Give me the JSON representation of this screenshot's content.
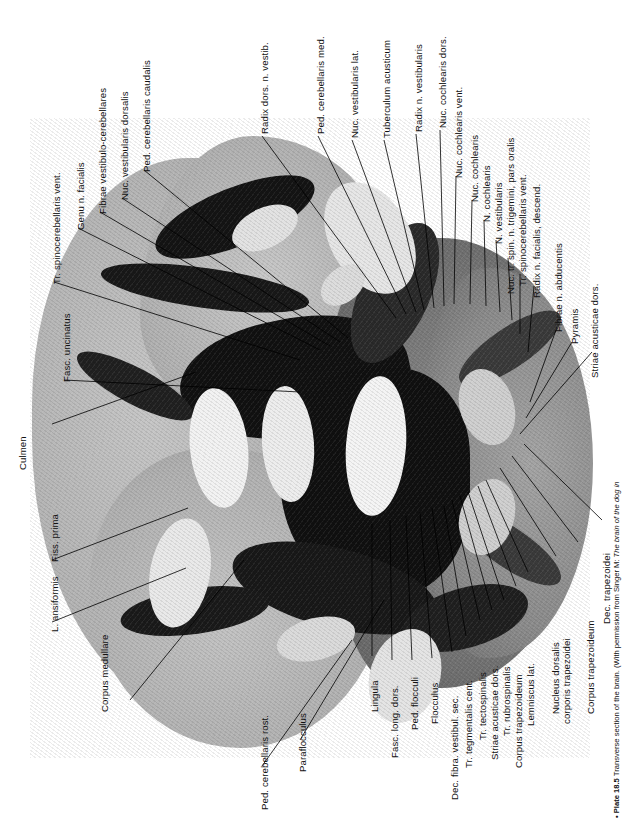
{
  "figure": {
    "plate_label": "Plate 18.5",
    "bullet": "•",
    "caption_main": "Transverse section of the brain. (With permission from Singer M:",
    "caption_italic": "The brain of the dog in",
    "caption_tail": ""
  },
  "labels_left": [
    {
      "id": "tr-spinocerebellaris-vent",
      "text": "Tr. spinocerebellaris vent."
    },
    {
      "id": "genu-n-facialis",
      "text": "Genu n. facialis"
    },
    {
      "id": "fibrae-vestibulo-cerebellares",
      "text": "Fibrae vestibulo-cerebellares"
    },
    {
      "id": "nuc-vestibularis-dorsalis",
      "text": "Nuc. vestibularis dorsalis"
    },
    {
      "id": "ped-cerebellaris-caudalis",
      "text": "Ped. cerebellaris caudalis"
    },
    {
      "id": "fasc-uncinatus",
      "text": "Fasc. uncinatus"
    },
    {
      "id": "culmen",
      "text": "Culmen"
    },
    {
      "id": "fiss-prima",
      "text": "Fiss. prima"
    },
    {
      "id": "l-ansiformis",
      "text": "L. ansiformis"
    },
    {
      "id": "corpus-medullare",
      "text": "Corpus medullare"
    },
    {
      "id": "ped-cerebellaris-rost",
      "text": "Ped. cerebellaris rost."
    },
    {
      "id": "paraflocculus",
      "text": "Paraflocculus"
    }
  ],
  "labels_bottom": [
    {
      "id": "lingula",
      "text": "Lingula"
    },
    {
      "id": "fasc-long-dors",
      "text": "Fasc. long. dors."
    },
    {
      "id": "ped-flocculi",
      "text": "Ped. flocculi"
    },
    {
      "id": "flocculus",
      "text": "Flocculus"
    },
    {
      "id": "dec-fibra-vestibul-sec",
      "text": "Dec. fibra. vestibul. sec."
    },
    {
      "id": "tr-tegmentalis-cent",
      "text": "Tr. tegmentalis cent."
    },
    {
      "id": "tr-tectospinalis",
      "text": "Tr. tectospinalis"
    },
    {
      "id": "striae-acusticae-dors",
      "text": "Striae acusticae dors."
    },
    {
      "id": "tr-rubrospinalis",
      "text": "Tr. rubrospinalis"
    },
    {
      "id": "corpus-trapezoideum-lower",
      "text": "Corpus trapezoideum"
    },
    {
      "id": "lemniscus-lat",
      "text": "Lemniscus lat."
    },
    {
      "id": "nucleus-dorsalis-corporis-trapezoidei-l1",
      "text": "Nucleus dorsalis"
    },
    {
      "id": "nucleus-dorsalis-corporis-trapezoidei-l2",
      "text": "corporis trapezoidei"
    },
    {
      "id": "corpus-trapezoideum-right",
      "text": "Corpus trapezoideum"
    },
    {
      "id": "dec-trapezoidei",
      "text": "Dec. trapezoidei"
    }
  ],
  "labels_top": [
    {
      "id": "radix-dors-n-vestib",
      "text": "Radix dors. n. vestib."
    },
    {
      "id": "ped-cerebellaris-med",
      "text": "Ped. cerebellaris med."
    },
    {
      "id": "nuc-vestibularis-lat",
      "text": "Nuc. vestibularis lat."
    },
    {
      "id": "tuberculum-acusticum",
      "text": "Tuberculum acusticum"
    },
    {
      "id": "radix-n-vestibularis",
      "text": "Radix n. vestibularis"
    },
    {
      "id": "nuc-cochlearis-dors",
      "text": "Nuc. cochlearis dors."
    },
    {
      "id": "nuc-cochlearis-vent",
      "text": "Nuc. cochlearis vent."
    },
    {
      "id": "nuc-cochlearis",
      "text": "Nuc. cochlearis"
    },
    {
      "id": "n-cochlearis",
      "text": "N. cochlearis"
    },
    {
      "id": "n-vestibularis",
      "text": "N. vestibularis"
    },
    {
      "id": "nuc-tr-spin-n-trigemini-pars-oralis",
      "text": "Nuc. tr. spin. n. trigemini, pars oralis"
    },
    {
      "id": "tr-spinocerebellaris-vent-right",
      "text": "Tr. spinocerebellaris vent."
    },
    {
      "id": "radix-n-facialis-descend",
      "text": "Radix n. facialis, descend."
    },
    {
      "id": "fibrae-n-abducentis",
      "text": "Fibrae n. abducentis"
    },
    {
      "id": "pyramis",
      "text": "Pyramis"
    },
    {
      "id": "striae-acusticae-dors-right",
      "text": "Striae acusticae dors."
    }
  ],
  "colors": {
    "ink": "#111111",
    "leader": "#000000",
    "page_bg": "#ffffff",
    "tissue_light": "#b9b9b9",
    "tissue_dark": "#1c1c1c"
  }
}
